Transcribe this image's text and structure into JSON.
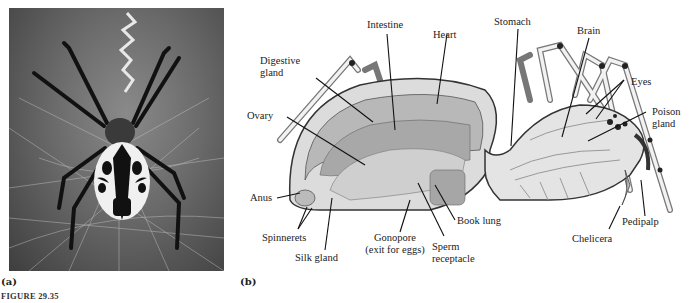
{
  "figure": {
    "caption": "FIGURE 29.35",
    "panel_a_label": "(a)",
    "panel_b_label": "(b)"
  },
  "panel_a": {
    "subject": "Photograph of an orb-weaver spider on its web, dorsal view"
  },
  "panel_b": {
    "subject": "Cutaway diagram of spider internal anatomy",
    "labels": {
      "intestine": "Intestine",
      "heart": "Heart",
      "stomach": "Stomach",
      "brain": "Brain",
      "digestive_gland_1": "Digestive",
      "digestive_gland_2": "gland",
      "eyes": "Eyes",
      "poison_gland_1": "Poison",
      "poison_gland_2": "gland",
      "ovary": "Ovary",
      "anus": "Anus",
      "spinnerets": "Spinnerets",
      "silk_gland": "Silk gland",
      "gonopore_1": "Gonopore",
      "gonopore_2": "(exit for eggs)",
      "book_lung": "Book lung",
      "sperm_receptacle_1": "Sperm",
      "sperm_receptacle_2": "receptacle",
      "chelicera": "Chelicera",
      "pedipalp": "Pedipalp"
    }
  },
  "colors": {
    "photo_dark": "#2a2a2a",
    "diagram_fill": "#c8c8c8",
    "diagram_line": "#333333"
  }
}
